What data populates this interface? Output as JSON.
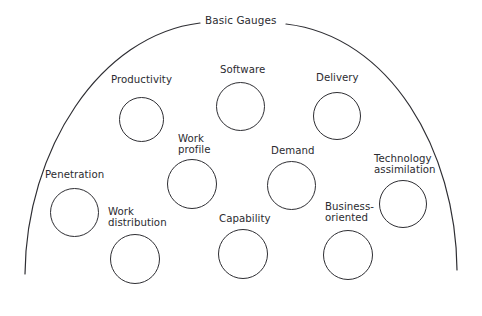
{
  "diagram": {
    "title": "Basic Gauges",
    "title_x": 205,
    "title_y": 14,
    "colors": {
      "stroke": "#2e2e33",
      "text": "#2b2b30",
      "background": "#ffffff"
    },
    "arc": {
      "shape": "dome",
      "left_end": [
        25,
        274
      ],
      "right_end": [
        457,
        270
      ],
      "apex_y": 22,
      "gap_for_title": true
    },
    "gauges": [
      {
        "id": "productivity",
        "label": "Productivity",
        "label_lines": [
          "Productivity"
        ],
        "label_x": 111,
        "label_y": 74,
        "cx": 141,
        "cy": 119,
        "r": 22.5
      },
      {
        "id": "software",
        "label": "Software",
        "label_lines": [
          "Software"
        ],
        "label_x": 220,
        "label_y": 64,
        "cx": 240,
        "cy": 106,
        "r": 24.5
      },
      {
        "id": "delivery",
        "label": "Delivery",
        "label_lines": [
          "Delivery"
        ],
        "label_x": 316,
        "label_y": 72,
        "cx": 337,
        "cy": 116,
        "r": 24
      },
      {
        "id": "work-profile",
        "label": "Work profile",
        "label_lines": [
          "Work",
          "profile"
        ],
        "label_x": 178,
        "label_y": 133,
        "cx": 192,
        "cy": 184,
        "r": 25
      },
      {
        "id": "demand",
        "label": "Demand",
        "label_lines": [
          "Demand"
        ],
        "label_x": 271,
        "label_y": 145,
        "cx": 291,
        "cy": 185,
        "r": 24.5
      },
      {
        "id": "technology-assimilation",
        "label": "Technology assimilation",
        "label_lines": [
          "Technology",
          "assimilation"
        ],
        "label_x": 374,
        "label_y": 153,
        "cx": 403,
        "cy": 204,
        "r": 24
      },
      {
        "id": "penetration",
        "label": "Penetration",
        "label_lines": [
          "Penetration"
        ],
        "label_x": 45,
        "label_y": 169,
        "cx": 74,
        "cy": 212,
        "r": 24.5
      },
      {
        "id": "work-distribution",
        "label": "Work distribution",
        "label_lines": [
          "Work",
          "distribution"
        ],
        "label_x": 108,
        "label_y": 206,
        "cx": 135,
        "cy": 259,
        "r": 25
      },
      {
        "id": "capability",
        "label": "Capability",
        "label_lines": [
          "Capability"
        ],
        "label_x": 219,
        "label_y": 213,
        "cx": 243,
        "cy": 254,
        "r": 25
      },
      {
        "id": "business-oriented",
        "label": "Business-oriented",
        "label_lines": [
          "Business-",
          "oriented"
        ],
        "label_x": 325,
        "label_y": 201,
        "cx": 348,
        "cy": 255,
        "r": 25
      }
    ]
  }
}
